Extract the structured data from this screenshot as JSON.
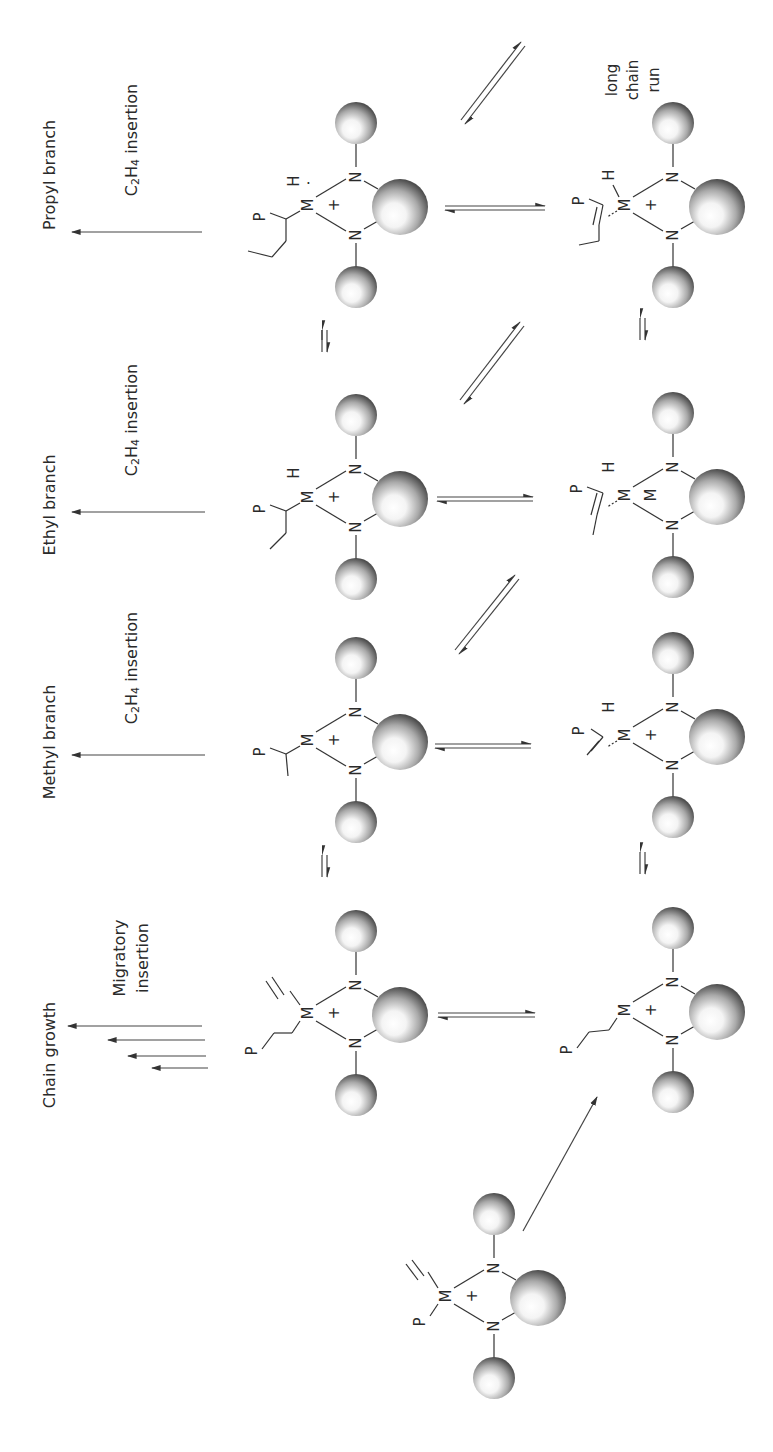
{
  "figure": {
    "orientation": "rotated-90-ccw",
    "background": "#ffffff",
    "sphere_color_dark": "#4a4a4a",
    "sphere_color_light": "#ffffff"
  },
  "labels": {
    "propyl_branch": "Propyl branch",
    "ethyl_branch": "Ethyl branch",
    "methyl_branch": "Methyl branch",
    "chain_growth": "Chain growth",
    "c2h4_insertion_1": "insertion",
    "c2h4_insertion_2": "insertion",
    "c2h4_insertion_3": "insertion",
    "c2h4_formula_c": "C",
    "c2h4_formula_sub2": "2",
    "c2h4_formula_h": "H",
    "c2h4_formula_sub4": "4",
    "migratory_line1": "Migratory",
    "migratory_line2": "insertion",
    "long_chain_line1": "long",
    "long_chain_line2": "chain",
    "long_chain_line3": "run"
  },
  "atoms": {
    "metal": "M",
    "nitrogen": "N",
    "hydride": "H",
    "polymer": "P",
    "charge": "+"
  },
  "species": [
    {
      "id": "propyl-alkyl",
      "description": "M-H with P-CH(propyl) alkyl"
    },
    {
      "id": "propyl-olefin-hydride",
      "description": "M-H with coordinated internal olefin (long chain run)"
    },
    {
      "id": "ethyl-alkyl",
      "description": "M-H with P-CH(ethyl) alkyl"
    },
    {
      "id": "ethyl-olefin-hydride",
      "description": "M-H with coordinated internal olefin"
    },
    {
      "id": "methyl-alkyl",
      "description": "M with P-CH(methyl) alkyl"
    },
    {
      "id": "methyl-olefin-hydride",
      "description": "M-H with coordinated vinyl olefin"
    },
    {
      "id": "olefin-alkyl",
      "description": "M with ethylene and P-CH2CH2 alkyl"
    },
    {
      "id": "alkyl",
      "description": "M with P-CH2CH2 alkyl"
    },
    {
      "id": "start-complex",
      "description": "M with ethylene and P"
    }
  ]
}
